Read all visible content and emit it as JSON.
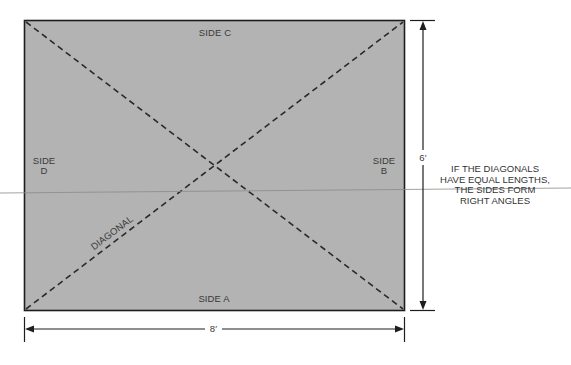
{
  "diagram": {
    "colors": {
      "fill": "#b3b3b3",
      "border": "#1e1e1e",
      "dash": "#2a2a2a",
      "text": "#3a3a3a",
      "crossline": "#8a8a8a"
    },
    "labels": {
      "side_a": "SIDE A",
      "side_b_line1": "SIDE",
      "side_b_line2": "B",
      "side_c": "SIDE C",
      "side_d_line1": "SIDE",
      "side_d_line2": "D",
      "diagonal": "DIAGONAL"
    },
    "dimensions": {
      "width": "8′",
      "height": "6′"
    },
    "note": {
      "line1": "IF THE DIAGONALS",
      "line2": "HAVE EQUAL LENGTHS,",
      "line3": "THE SIDES FORM",
      "line4": "RIGHT ANGLES"
    }
  }
}
